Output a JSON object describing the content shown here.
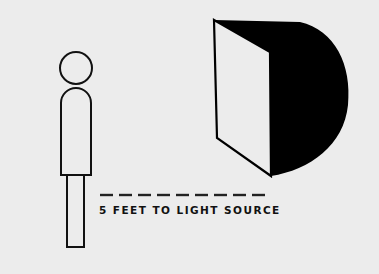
{
  "diagram": {
    "background_color": "#ececec",
    "stroke_color": "#111111",
    "elements": {
      "person": {
        "kind": "stick-figure-outline",
        "parts": [
          "head",
          "torso",
          "legs"
        ]
      },
      "light_source": {
        "kind": "softbox",
        "front_face_color": "#ececec",
        "body_color": "#000000"
      },
      "distance_line": {
        "kind": "dashed-line",
        "dash_count": 9
      }
    },
    "label": "5 FEET TO LIGHT SOURCE"
  }
}
